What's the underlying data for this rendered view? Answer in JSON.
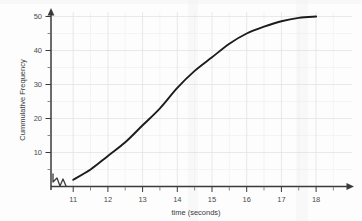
{
  "chart_data": {
    "type": "line",
    "title": "",
    "xlabel": "time (seconds)",
    "ylabel": "Cummulative Frequency",
    "xlim": [
      10.6,
      18.6
    ],
    "ylim": [
      0,
      52
    ],
    "xticks": [
      "11",
      "12",
      "13",
      "14",
      "15",
      "16",
      "17",
      "18"
    ],
    "yticks": [
      "10",
      "20",
      "30",
      "40",
      "50"
    ],
    "grid": true,
    "legend": null,
    "axis_break": "x-axis zigzag break between origin and 11",
    "x": [
      11,
      11.5,
      12,
      12.5,
      13,
      13.5,
      14,
      14.5,
      15,
      15.5,
      16,
      16.5,
      17,
      17.5,
      18
    ],
    "values": [
      2,
      5,
      9,
      13,
      18,
      23,
      29,
      34,
      38,
      42,
      45,
      47,
      48.6,
      49.6,
      50
    ],
    "series": [
      {
        "name": "Cumulative Frequency",
        "values": [
          2,
          5,
          9,
          13,
          18,
          23,
          29,
          34,
          38,
          42,
          45,
          47,
          48.6,
          49.6,
          50
        ]
      }
    ],
    "colors": {
      "curve": "#1c1c1c",
      "grid_major": "#dcdfe4",
      "grid_minor": "#eceef1",
      "axis": "#3a3a3a",
      "background": "#fdfdfd"
    }
  },
  "axis": {
    "x_label": "time (seconds)",
    "y_label": "Cummulative Frequency",
    "x_tick_labels": [
      "11",
      "12",
      "13",
      "14",
      "15",
      "16",
      "17",
      "18"
    ],
    "y_tick_labels": [
      "10",
      "20",
      "30",
      "40",
      "50"
    ]
  }
}
